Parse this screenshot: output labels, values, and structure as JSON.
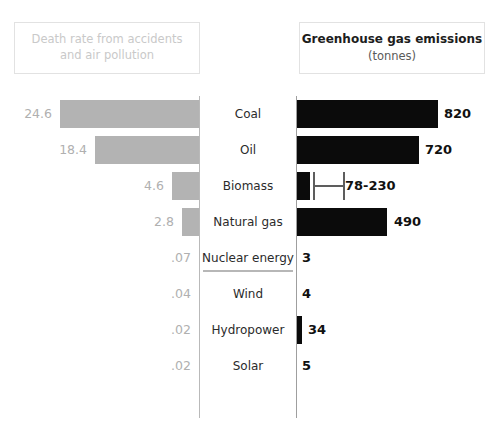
{
  "left_panel": {
    "title_line1": "Death rate from accidents",
    "title_line2": "and air pollution"
  },
  "right_panel": {
    "title": "Greenhouse gas emissions",
    "subtitle": "(tonnes)"
  },
  "colors": {
    "left_bar": "#b3b3b3",
    "right_bar": "#0b0b0b",
    "left_label_text": "#b0b0b0",
    "right_label_text": "#111111",
    "axis": "#b9b9b9",
    "header_border": "#e2e2e2",
    "background": "#ffffff"
  },
  "chart_data": {
    "type": "bar",
    "orientation": "horizontal-diverging",
    "categories": [
      "Coal",
      "Oil",
      "Biomass",
      "Natural gas",
      "Nuclear energy",
      "Wind",
      "Hydropower",
      "Solar"
    ],
    "series": [
      {
        "name": "Death rate from accidents and air pollution",
        "side": "left",
        "color": "#b3b3b3",
        "values": [
          24.6,
          18.4,
          4.6,
          2.8,
          0.07,
          0.04,
          0.02,
          0.02
        ],
        "labels": [
          "24.6",
          "18.4",
          "4.6",
          "2.8",
          ".07",
          ".04",
          ".02",
          ".02"
        ]
      },
      {
        "name": "Greenhouse gas emissions (tonnes)",
        "side": "right",
        "color": "#0b0b0b",
        "values": [
          820,
          720,
          230,
          490,
          3,
          4,
          34,
          5
        ],
        "labels": [
          "820",
          "720",
          "78-230",
          "490",
          "3",
          "4",
          "34",
          "5"
        ],
        "range_low": [
          null,
          null,
          78,
          null,
          null,
          null,
          null,
          null
        ],
        "range_high": [
          null,
          null,
          230,
          null,
          null,
          null,
          null,
          null
        ]
      }
    ],
    "xlabel": "",
    "ylabel": "",
    "grid": false,
    "legend": "none",
    "annotations": [
      "Nuclear energy row label is underlined"
    ]
  },
  "rows": [
    {
      "category": "Coal",
      "left_label": "24.6",
      "right_label": "820",
      "left_bar_width": 139,
      "right_bar_width": 141,
      "right_label_left": 444,
      "underline": false,
      "range": null
    },
    {
      "category": "Oil",
      "left_label": "18.4",
      "right_label": "720",
      "left_bar_width": 104,
      "right_bar_width": 122,
      "right_label_left": 425,
      "underline": false,
      "range": null
    },
    {
      "category": "Biomass",
      "left_label": "4.6",
      "right_label": "78-230",
      "left_bar_width": 27,
      "right_bar_width": 13,
      "right_label_left": 345,
      "underline": false,
      "range": {
        "left": 313,
        "width": 32
      }
    },
    {
      "category": "Natural gas",
      "left_label": "2.8",
      "right_label": "490",
      "left_bar_width": 17,
      "right_bar_width": 90,
      "right_label_left": 394,
      "underline": false,
      "range": null
    },
    {
      "category": "Nuclear energy",
      "left_label": ".07",
      "right_label": "3",
      "left_bar_width": 0,
      "right_bar_width": 0,
      "right_label_left": 302,
      "underline": true,
      "range": null
    },
    {
      "category": "Wind",
      "left_label": ".04",
      "right_label": "4",
      "left_bar_width": 0,
      "right_bar_width": 0,
      "right_label_left": 302,
      "underline": false,
      "range": null
    },
    {
      "category": "Hydropower",
      "left_label": ".02",
      "right_label": "34",
      "left_bar_width": 0,
      "right_bar_width": 5,
      "right_label_left": 308,
      "underline": false,
      "range": null
    },
    {
      "category": "Solar",
      "left_label": ".02",
      "right_label": "5",
      "left_bar_width": 0,
      "right_bar_width": 0,
      "right_label_left": 302,
      "underline": false,
      "range": null
    }
  ]
}
